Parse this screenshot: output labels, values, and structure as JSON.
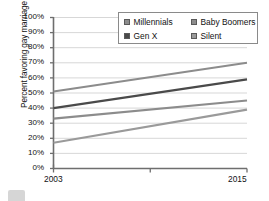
{
  "chart_data": {
    "type": "line",
    "title": "",
    "xlabel": "",
    "ylabel": "Percent favoring gay marriage",
    "x": [
      2003,
      2015
    ],
    "xlim": [
      2003,
      2015
    ],
    "ylim": [
      0,
      100
    ],
    "xtick_labels": [
      "2003",
      "2015"
    ],
    "ytick_labels": [
      "0%",
      "10%",
      "20%",
      "30%",
      "40%",
      "50%",
      "60%",
      "70%",
      "80%",
      "90%",
      "100%"
    ],
    "ytick_values": [
      0,
      10,
      20,
      30,
      40,
      50,
      60,
      70,
      80,
      90,
      100
    ],
    "grid": true,
    "legend_position": "top-right",
    "series": [
      {
        "name": "Millennials",
        "values": [
          51,
          70
        ],
        "color": "#8c8c8c"
      },
      {
        "name": "Baby Boomers",
        "values": [
          33,
          45
        ],
        "color": "#8c8c8c"
      },
      {
        "name": "Gen X",
        "values": [
          40,
          59
        ],
        "color": "#4a4a4a"
      },
      {
        "name": "Silent",
        "values": [
          17,
          39
        ],
        "color": "#9a9a9a"
      }
    ]
  },
  "legend": {
    "items": [
      {
        "label": "Millennials",
        "swatch": "#8c8c8c"
      },
      {
        "label": "Baby Boomers",
        "swatch": "#8c8c8c"
      },
      {
        "label": "Gen X",
        "swatch": "#4a4a4a"
      },
      {
        "label": "Silent",
        "swatch": "#9a9a9a"
      }
    ]
  },
  "axes": {
    "y_title": "Percent favoring gay marriage",
    "x_start_label": "2003",
    "x_end_label": "2015"
  }
}
